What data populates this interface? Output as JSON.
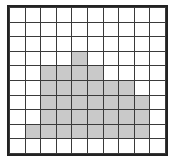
{
  "figure": {
    "title": "Shaded cells on a square grid",
    "type": "grid-diagram",
    "rows": 10,
    "columns": 10,
    "colors": {
      "background": "#ffffff",
      "cell_fill_empty": "#ffffff",
      "cell_fill_shaded": "#c9c9c9",
      "grid_line": "#3a3a3a",
      "outer_border": "#222222"
    },
    "counts": {
      "total_cells": 100,
      "shaded_cells": 35,
      "empty_cells": 65
    },
    "row_labels": [
      "1",
      "2",
      "3",
      "4",
      "5",
      "6",
      "7",
      "8",
      "9",
      "10"
    ],
    "column_labels": [
      "1",
      "2",
      "3",
      "4",
      "5",
      "6",
      "7",
      "8",
      "9",
      "10"
    ],
    "shaded_runs": [
      {
        "row": 4,
        "from_column": 5,
        "to_column": 5,
        "count": 1
      },
      {
        "row": 5,
        "from_column": 3,
        "to_column": 6,
        "count": 4
      },
      {
        "row": 6,
        "from_column": 3,
        "to_column": 8,
        "count": 6
      },
      {
        "row": 7,
        "from_column": 3,
        "to_column": 9,
        "count": 7
      },
      {
        "row": 8,
        "from_column": 3,
        "to_column": 9,
        "count": 7
      },
      {
        "row": 9,
        "from_column": 2,
        "to_column": 9,
        "count": 8
      }
    ],
    "cells": [
      [
        0,
        0,
        0,
        0,
        0,
        0,
        0,
        0,
        0,
        0
      ],
      [
        0,
        0,
        0,
        0,
        0,
        0,
        0,
        0,
        0,
        0
      ],
      [
        0,
        0,
        0,
        0,
        0,
        0,
        0,
        0,
        0,
        0
      ],
      [
        0,
        0,
        0,
        0,
        1,
        0,
        0,
        0,
        0,
        0
      ],
      [
        0,
        0,
        1,
        1,
        1,
        1,
        0,
        0,
        0,
        0
      ],
      [
        0,
        0,
        1,
        1,
        1,
        1,
        1,
        1,
        0,
        0
      ],
      [
        0,
        0,
        1,
        1,
        1,
        1,
        1,
        1,
        1,
        0
      ],
      [
        0,
        0,
        1,
        1,
        1,
        1,
        1,
        1,
        1,
        0
      ],
      [
        0,
        1,
        1,
        1,
        1,
        1,
        1,
        1,
        1,
        0
      ],
      [
        0,
        0,
        0,
        0,
        0,
        0,
        0,
        0,
        0,
        0
      ]
    ]
  }
}
